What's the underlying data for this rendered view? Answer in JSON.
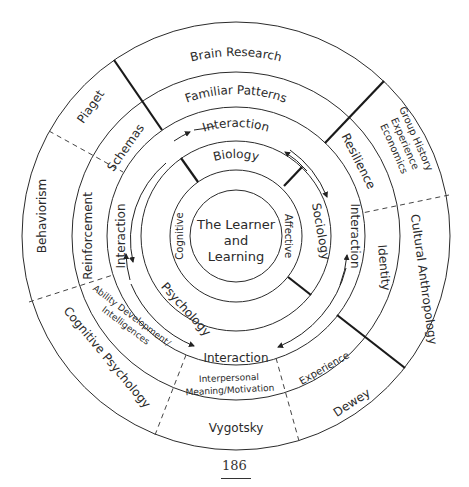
{
  "center": {
    "line1": "The Learner",
    "line2": "and",
    "line3": "Learning"
  },
  "ring1": {
    "left": "Cognitive",
    "right": "Affective"
  },
  "ring2": {
    "top": "Biology",
    "right": "Sociology",
    "left": "Psychology"
  },
  "ring3": {
    "top": "Interaction",
    "right": "Interaction",
    "bottom": "Interaction",
    "left": "Interaction"
  },
  "ring4": {
    "top": "Familiar Patterns",
    "upper_left": "Schemas",
    "left": "Reinforcement",
    "lower_left_1": "Ability Development/",
    "lower_left_2": "Intelligences",
    "bottom_1": "Interpersonal",
    "bottom_2": "Meaning/Motivation",
    "lower_right": "Experience",
    "right": "Identity",
    "upper_right": "Resilience"
  },
  "ring5": {
    "top": "Brain Research",
    "upper_left": "Piaget",
    "left": "Behaviorism",
    "lower_left": "Cognitive Psychology",
    "bottom": "Vygotsky",
    "lower_right": "Dewey",
    "right": "Cultural Anthropology",
    "upper_right_1": "Group History",
    "upper_right_2": "Experience",
    "upper_right_3": "Economics"
  },
  "page_number": "186"
}
